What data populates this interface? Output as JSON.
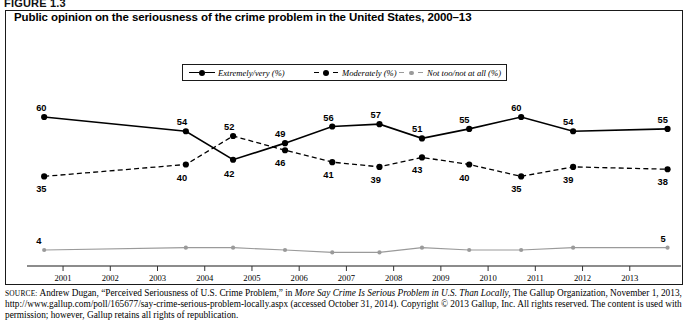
{
  "figure_label": "FIGURE 1.3",
  "title": "Public opinion on the seriousness of the crime problem in the United States, 2000–13",
  "legend": [
    {
      "label": "Extremely/very (%)",
      "style": "solid",
      "color": "#000000"
    },
    {
      "label": "Moderately (%)",
      "style": "dashed",
      "color": "#000000"
    },
    {
      "label": "Not too/not at all (%)",
      "style": "solid-light",
      "color": "#9a9a9a"
    }
  ],
  "source": {
    "prefix": "SOURCE:",
    "text_1": " Andrew Dugan, “Perceived Seriousness of U.S. Crime Problem,” in ",
    "italic_1": "More Say Crime Is Serious Problem in U.S. Than Locally,",
    "text_2": " The Gallup Organization, November 1, 2013, http://www.gallup.com/poll/165677/say-crime-serious-problem-locally.aspx (accessed October 31, 2014). Copyright © 2013 Gallup, Inc. All rights reserved. The content is used with permission; however, Gallup retains all rights of republication."
  },
  "chart_data": {
    "type": "line",
    "title": "Public opinion on the seriousness of the crime problem in the United States, 2000–13",
    "xlabel": "",
    "ylabel": "",
    "xlim": [
      2000.3,
      2014.0
    ],
    "ylim": [
      0,
      64
    ],
    "grid": false,
    "legend_position": "top-center",
    "xticks": [
      "2001",
      "2002",
      "2003",
      "2004",
      "2005",
      "2006",
      "2007",
      "2008",
      "2009",
      "2010",
      "2011",
      "2012",
      "2013"
    ],
    "x": [
      2000.6,
      2003.6,
      2004.6,
      2005.7,
      2006.7,
      2007.7,
      2008.6,
      2009.6,
      2010.7,
      2011.8,
      2013.8
    ],
    "series": [
      {
        "name": "Extremely/very (%)",
        "color": "#000000",
        "style": "solid",
        "values": [
          60,
          54,
          42,
          49,
          56,
          57,
          51,
          55,
          60,
          54,
          55
        ],
        "labels": [
          "60",
          "54",
          "42",
          "49",
          "56",
          "57",
          "51",
          "55",
          "60",
          "54",
          "55"
        ]
      },
      {
        "name": "Moderately (%)",
        "color": "#000000",
        "style": "dashed",
        "values": [
          35,
          40,
          52,
          46,
          41,
          39,
          43,
          40,
          35,
          39,
          38
        ],
        "labels": [
          "35",
          "40",
          "52",
          "46",
          "41",
          "39",
          "43",
          "40",
          "35",
          "39",
          "38"
        ]
      },
      {
        "name": "Not too/not at all (%)",
        "color": "#9a9a9a",
        "style": "solid-light",
        "values": [
          4,
          5,
          5,
          4,
          3,
          3,
          5,
          4,
          4,
          5,
          5
        ],
        "labels": [
          "4",
          "",
          "",
          "",
          "",
          "",
          "",
          "",
          "",
          "",
          "5"
        ]
      }
    ]
  }
}
